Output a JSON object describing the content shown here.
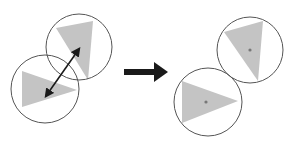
{
  "diagram": {
    "colors": {
      "circle_stroke": "#555555",
      "triangle_fill": "#c4c4c4",
      "arrow": "#1a1a1a",
      "dot": "#777777",
      "background": "#ffffff"
    },
    "before": {
      "shapes": [
        {
          "circle": {
            "cx": 79,
            "cy": 47,
            "r": 33
          },
          "triangle": "56,28 93,21 88,80",
          "dot": {
            "cx": 79,
            "cy": 49
          }
        },
        {
          "circle": {
            "cx": 45,
            "cy": 89,
            "r": 34
          },
          "triangle": "22,71 77,90 22,107",
          "dot": {
            "cx": 46,
            "cy": 96
          }
        }
      ],
      "connector": {
        "type": "double-arrow",
        "x1": 79,
        "y1": 49,
        "x2": 46,
        "y2": 96
      }
    },
    "transition_arrow": {
      "x1": 124,
      "y": 72,
      "x2": 168
    },
    "after": {
      "shapes": [
        {
          "circle": {
            "cx": 250,
            "cy": 50,
            "r": 33
          },
          "triangle": "224,32 263,21 258,81",
          "dot": {
            "cx": 250,
            "cy": 50
          }
        },
        {
          "circle": {
            "cx": 208,
            "cy": 102,
            "r": 34
          },
          "triangle": "182,81 238,101 182,123",
          "dot": {
            "cx": 206,
            "cy": 102
          }
        }
      ]
    }
  }
}
